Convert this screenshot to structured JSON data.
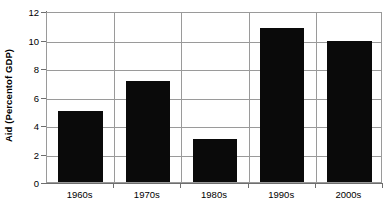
{
  "chart_data": {
    "type": "bar",
    "title": "",
    "subtitle": "",
    "xlabel": "",
    "ylabel": "Aid (Percentof GDP)",
    "categories": [
      "1960s",
      "1970s",
      "1980s",
      "1990s",
      "2000s"
    ],
    "values": [
      5.0,
      7.1,
      3.0,
      10.8,
      9.9
    ],
    "ylim": [
      0,
      12
    ],
    "y_ticks": [
      0,
      2,
      4,
      6,
      8,
      10,
      12
    ],
    "y_tick_labels": [
      "0",
      "2",
      "4",
      "6",
      "8",
      "10",
      "12"
    ],
    "grid": {
      "horizontal": true,
      "vertical": true
    },
    "legend": {
      "visible": false,
      "position": "none",
      "entries": []
    },
    "annotations": [],
    "colors": {
      "bar": "#0a0a0a",
      "grid": "#9a9a9a",
      "axis": "#6e6e6e",
      "background": "#ffffff",
      "text": "#000000"
    }
  }
}
